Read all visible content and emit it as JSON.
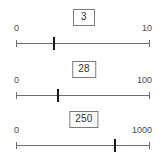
{
  "panel": {
    "title": "slider-group",
    "accent_color": "#1a1a1a",
    "track_color": "#6d6d6d",
    "box_border_color": "#7a7a7a",
    "text_color": "#3c3c3c"
  },
  "sliders": [
    {
      "name": "slider-1",
      "value": "3",
      "min_label": "0",
      "max_label": "10",
      "min": 0,
      "max": 10,
      "thumb_percent": 28
    },
    {
      "name": "slider-2",
      "value": "28",
      "min_label": "0",
      "max_label": "100",
      "min": 0,
      "max": 100,
      "thumb_percent": 31
    },
    {
      "name": "slider-3",
      "value": "250",
      "min_label": "0",
      "max_label": "1000",
      "min": 0,
      "max": 1000,
      "thumb_percent": 74
    }
  ]
}
